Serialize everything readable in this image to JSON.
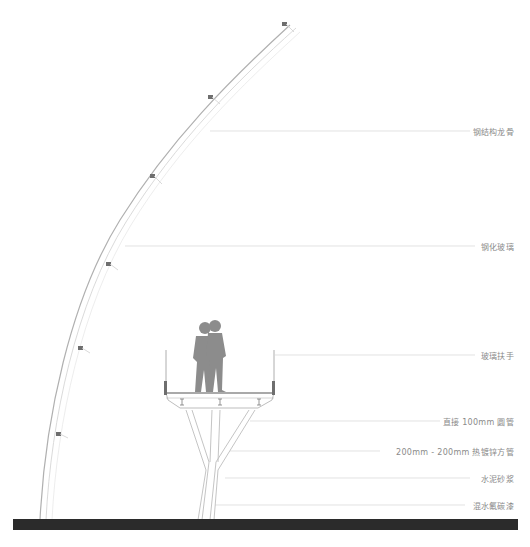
{
  "diagram": {
    "type": "architectural-section",
    "annotations": [
      {
        "id": "steel-keel",
        "text": "钢结构龙骨",
        "y": 131
      },
      {
        "id": "tempered-glass",
        "text": "钢化玻璃",
        "y": 246
      },
      {
        "id": "glass-handrail",
        "text": "玻璃扶手",
        "y": 355
      },
      {
        "id": "round-tube",
        "text": "直接 100mm 圆管",
        "y": 421
      },
      {
        "id": "square-tube",
        "text": "200mm - 200mm 热镀锌方管",
        "y": 451
      },
      {
        "id": "cement-mortar",
        "text": "水泥砂浆",
        "y": 478
      },
      {
        "id": "fluorocarbon-paint",
        "text": "混水氟碳漆",
        "y": 505
      }
    ],
    "colors": {
      "line": "#c8c8c8",
      "structure": "#b5b5b5",
      "figure": "#8c8c8c",
      "ground": "#2b2b2b",
      "text": "#8a8a8a"
    }
  }
}
